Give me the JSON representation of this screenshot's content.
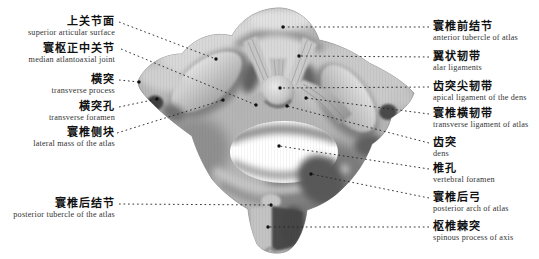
{
  "figure": {
    "language": "Chinese / English bilingual anatomy labels"
  },
  "colors": {
    "background": "#ffffff",
    "chinese_label_text": "#111111",
    "english_label_text": "#333333",
    "leader_line": "#222222",
    "bone_light": "#d9d9d9",
    "bone_mid": "#b5b5b5",
    "bone_dark": "#4a4a4a"
  },
  "labels": {
    "left": [
      {
        "cn": "上关节面",
        "en": "superior articular surface",
        "lx": 119,
        "ly": 22,
        "tx": 216,
        "ty": 59
      },
      {
        "cn": "寰枢正中关节",
        "en": "median atlantoaxial joint",
        "lx": 121,
        "ly": 49,
        "tx": 256,
        "ty": 105
      },
      {
        "cn": "横突",
        "en": "transverse process",
        "lx": 119,
        "ly": 80,
        "tx": 139,
        "ty": 82
      },
      {
        "cn": "横突孔",
        "en": "transverse foramen",
        "lx": 119,
        "ly": 107,
        "tx": 157,
        "ty": 99
      },
      {
        "cn": "寰椎侧块",
        "en": "lateral mass of the atlas",
        "lx": 117,
        "ly": 133,
        "tx": 223,
        "ty": 100
      },
      {
        "cn": "寰椎后结节",
        "en": "posterior tubercle of the atlas",
        "lx": 119,
        "ly": 204,
        "tx": 271,
        "ty": 205
      }
    ],
    "right": [
      {
        "cn": "寰椎前结节",
        "en": "anterior tubercle of atlas",
        "lx": 429,
        "ly": 27,
        "tx": 283,
        "ty": 27
      },
      {
        "cn": "翼状韧带",
        "en": "alar ligaments",
        "lx": 429,
        "ly": 57,
        "tx": 299,
        "ty": 56
      },
      {
        "cn": "齿突尖韧带",
        "en": "apical ligament of the dens",
        "lx": 429,
        "ly": 87,
        "tx": 280,
        "ty": 88
      },
      {
        "cn": "寰椎横韧带",
        "en": "transverse ligament of atlas",
        "lx": 429,
        "ly": 114,
        "tx": 306,
        "ty": 98
      },
      {
        "cn": "齿突",
        "en": "dens",
        "lx": 429,
        "ly": 143,
        "tx": 287,
        "ty": 106
      },
      {
        "cn": "椎孔",
        "en": "vertebral foramen",
        "lx": 429,
        "ly": 169,
        "tx": 279,
        "ty": 146
      },
      {
        "cn": "寰椎后弓",
        "en": "posterior arch of atlas",
        "lx": 429,
        "ly": 198,
        "tx": 311,
        "ty": 174
      },
      {
        "cn": "枢椎棘突",
        "en": "spinous process of axis",
        "lx": 429,
        "ly": 227,
        "tx": 268,
        "ty": 227
      }
    ]
  }
}
